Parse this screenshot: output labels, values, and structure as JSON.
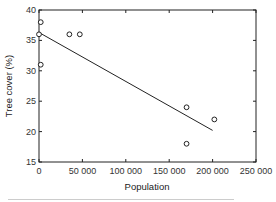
{
  "chart_data": {
    "type": "scatter",
    "title": "",
    "xlabel": "Population",
    "ylabel": "Tree cover (%)",
    "xlim": [
      0,
      250000
    ],
    "ylim": [
      15,
      40
    ],
    "xticks": [
      0,
      50000,
      100000,
      150000,
      200000,
      250000
    ],
    "xtick_labels": [
      "0",
      "50 000",
      "100 000",
      "150 000",
      "200 000",
      "250 000"
    ],
    "yticks": [
      15,
      20,
      25,
      30,
      35,
      40
    ],
    "ytick_labels": [
      "15",
      "20",
      "25",
      "30",
      "35",
      "40"
    ],
    "grid": false,
    "legend": null,
    "series": [
      {
        "name": "observations",
        "marker": "open-circle",
        "points": [
          {
            "x": 0,
            "y": 36
          },
          {
            "x": 2000,
            "y": 38
          },
          {
            "x": 2000,
            "y": 31
          },
          {
            "x": 35000,
            "y": 36
          },
          {
            "x": 47000,
            "y": 36
          },
          {
            "x": 170000,
            "y": 24
          },
          {
            "x": 170000,
            "y": 18
          },
          {
            "x": 202000,
            "y": 22
          }
        ]
      },
      {
        "name": "regression line",
        "type": "line",
        "points": [
          {
            "x": 0,
            "y": 36.3
          },
          {
            "x": 200000,
            "y": 20.2
          }
        ]
      }
    ]
  },
  "labels": {
    "xlabel": "Population",
    "ylabel": "Tree cover (%)"
  },
  "colors": {
    "axis": "#222222",
    "marker": "#222222",
    "line": "#222222"
  }
}
